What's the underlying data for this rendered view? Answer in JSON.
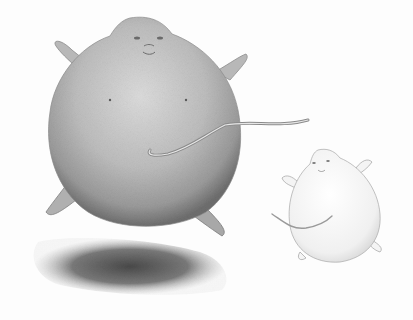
{
  "image": {
    "description": "Pencil drawing of a large inflated balloon-like rat creature with outstretched limbs and tail, a smaller lightly sketched white version on the right, and a shaded shadow below",
    "style": "graphite pencil illustration",
    "colors": {
      "background": "#fdfdfd",
      "large_body_light": "#d4d4d4",
      "large_body_mid": "#b0b0b0",
      "large_body_dark": "#7a7a7a",
      "shadow": "#5a5a5a",
      "small_body": "#f2f2f2",
      "small_outline": "#9a9a9a"
    },
    "subjects": [
      {
        "name": "large-inflated-creature",
        "shade": "gray"
      },
      {
        "name": "small-inflated-creature",
        "shade": "white"
      },
      {
        "name": "ground-shadow",
        "shade": "dark-gray"
      }
    ]
  }
}
